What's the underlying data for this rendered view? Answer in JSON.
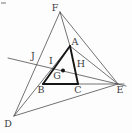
{
  "figure": {
    "type": "geometry-diagram",
    "background": "#fdfdfd",
    "thin_color": "#4f4f4f",
    "bold_color": "#161616",
    "label_color": "#3c3c3c",
    "label_font_size": 9.5,
    "thin_width": 0.8,
    "bold_width": 1.9,
    "points": {
      "A": [
        70,
        46
      ],
      "B": [
        43,
        84
      ],
      "C": [
        78,
        84
      ],
      "D": [
        14,
        116
      ],
      "E": [
        118,
        84
      ],
      "F": [
        60,
        12
      ],
      "G": [
        63,
        71
      ],
      "H": [
        76,
        73
      ],
      "I": [
        54,
        69
      ],
      "J": [
        37,
        65
      ]
    },
    "lines": [
      {
        "name": "edge-D-F",
        "x1": 14,
        "y1": 116,
        "x2": 60,
        "y2": 12,
        "bold": false
      },
      {
        "name": "edge-F-E",
        "x1": 60,
        "y1": 12,
        "x2": 118,
        "y2": 84,
        "bold": false
      },
      {
        "name": "edge-D-E",
        "x1": 14,
        "y1": 116,
        "x2": 118,
        "y2": 84,
        "bold": false
      },
      {
        "name": "segment-F-A",
        "x1": 60,
        "y1": 12,
        "x2": 70,
        "y2": 46,
        "bold": false
      },
      {
        "name": "segment-A-E",
        "x1": 70,
        "y1": 46,
        "x2": 118,
        "y2": 84,
        "bold": false
      },
      {
        "name": "segment-D-A",
        "x1": 14,
        "y1": 116,
        "x2": 70,
        "y2": 46,
        "bold": false
      },
      {
        "name": "transversal-J-I-G-H-E",
        "x1": 8,
        "y1": 58,
        "x2": 126,
        "y2": 86,
        "bold": false
      },
      {
        "name": "line-B-C-E-extended",
        "x1": 43,
        "y1": 84,
        "x2": 124,
        "y2": 84,
        "bold": false
      },
      {
        "name": "bold-edge-A-B",
        "x1": 70,
        "y1": 46,
        "x2": 43,
        "y2": 84,
        "bold": true
      },
      {
        "name": "bold-edge-B-C",
        "x1": 43,
        "y1": 84,
        "x2": 78,
        "y2": 84,
        "bold": true
      },
      {
        "name": "bold-edge-A-C",
        "x1": 70,
        "y1": 46,
        "x2": 78,
        "y2": 84,
        "bold": true
      }
    ],
    "dot": {
      "name": "point-G-dot",
      "x": 63,
      "y": 70.5,
      "r": 2
    },
    "labels": [
      {
        "text": "F",
        "x": 55,
        "y": 8
      },
      {
        "text": "A",
        "x": 75,
        "y": 42
      },
      {
        "text": "J",
        "x": 33,
        "y": 56
      },
      {
        "text": "I",
        "x": 51,
        "y": 61
      },
      {
        "text": "H",
        "x": 81,
        "y": 64
      },
      {
        "text": "G",
        "x": 57,
        "y": 76
      },
      {
        "text": "B",
        "x": 41,
        "y": 90
      },
      {
        "text": "C",
        "x": 78,
        "y": 90
      },
      {
        "text": "E",
        "x": 120,
        "y": 90
      },
      {
        "text": "D",
        "x": 8,
        "y": 124
      }
    ],
    "corner_artifact": {
      "x": 1,
      "y": 2,
      "width": 5,
      "height": 2,
      "color": "#b9b9b9"
    }
  }
}
